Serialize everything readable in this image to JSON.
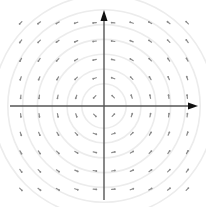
{
  "diagram": {
    "type": "vector-field",
    "field": {
      "u": "-y",
      "v": "x"
    },
    "grid": {
      "cols": 10,
      "rows": 10,
      "range": [
        -4.5,
        4.5
      ]
    },
    "streamline_circles": [
      1.2,
      2.0,
      2.8,
      3.6,
      4.4,
      5.2,
      6.0
    ],
    "origin_px": [
      104,
      106
    ],
    "scale_px_per_unit": 18.5,
    "colors": {
      "axis": "#555555",
      "arrowhead": "#111111",
      "vector": "#8a8a8a",
      "streamline": "#ececec",
      "background": "#ffffff"
    },
    "axes": {
      "x": {
        "from": [
          10,
          106
        ],
        "to": [
          198,
          106
        ]
      },
      "y": {
        "from": [
          104,
          200
        ],
        "to": [
          104,
          10
        ]
      }
    }
  }
}
